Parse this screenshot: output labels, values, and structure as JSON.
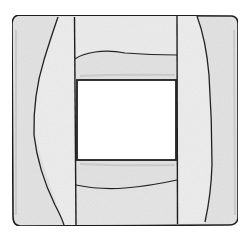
{
  "image": {
    "subject": "Pencil sketch of a square wooden frame with a square window",
    "caption": "Square frame sketch",
    "colors": {
      "background": "#ffffff",
      "frame_fill": "#e6e6e6",
      "frame_fill_light": "#eeeeee",
      "outline": "#1e1e1e",
      "window": "#ffffff"
    }
  }
}
